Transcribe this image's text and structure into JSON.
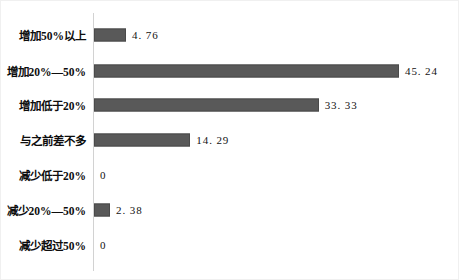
{
  "chart_data": {
    "type": "bar",
    "orientation": "horizontal",
    "title": "",
    "subtitle": "",
    "xlabel": "",
    "ylabel": "",
    "grid": false,
    "legend": null,
    "xlim": [
      0,
      45.24
    ],
    "axis_line_color": "#d2d2d2",
    "bar_color": "#595959",
    "background": "#ffffff",
    "categories": [
      "增加50%以上",
      "增加20%—50%",
      "增加低于20%",
      "与之前差不多",
      "减少低于20%",
      "减少20%—50%",
      "减少超过50%"
    ],
    "values": [
      4.76,
      45.24,
      33.33,
      14.29,
      0,
      2.38,
      0
    ],
    "value_labels": [
      "4. 76",
      "45. 24",
      "33. 33",
      "14. 29",
      "0",
      "2. 38",
      "0"
    ]
  }
}
